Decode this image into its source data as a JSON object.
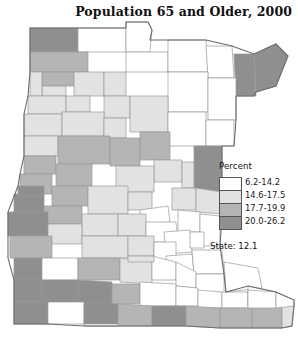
{
  "title": "Population 65 and Older, 2000",
  "legend": {
    "heading": "Percent",
    "classes": [
      {
        "label": "6.2-14.2",
        "color": "#ffffff"
      },
      {
        "label": "14.6-17.5",
        "color": "#e2e2e2"
      },
      {
        "label": "17.7-19.9",
        "color": "#b5b5b5"
      },
      {
        "label": "20.0-26.2",
        "color": "#8f8f8f"
      }
    ],
    "state_label": "State: 12.1"
  },
  "map": {
    "region": "Minnesota",
    "unit": "county",
    "outline_color": "#6b6b6b",
    "border_color": "#9a9a9a",
    "counties": [
      {
        "name": "Kittson",
        "class": 3,
        "d": "M30,28 L78,28 L78,52 L30,52 Z"
      },
      {
        "name": "Roseau",
        "class": 0,
        "d": "M78,28 L126,28 L126,52 L78,52 Z"
      },
      {
        "name": "Lake of the Woods",
        "class": 0,
        "d": "M126,22 L148,22 L152,30 L150,52 L126,52 Z"
      },
      {
        "name": "Marshall",
        "class": 2,
        "d": "M30,52 L88,52 L88,72 L30,72 Z"
      },
      {
        "name": "Beltrami-N",
        "class": 0,
        "d": "M126,52 L168,52 L168,72 L126,72 Z"
      },
      {
        "name": "Koochiching",
        "class": 0,
        "d": "M168,40 L206,40 L208,72 L168,72 Z"
      },
      {
        "name": "St. Louis-N",
        "class": 0,
        "d": "M206,46 L232,46 L234,78 L208,78 Z"
      },
      {
        "name": "Lake",
        "class": 3,
        "d": "M234,54 L254,54 L256,96 L236,96 Z"
      },
      {
        "name": "Cook",
        "class": 3,
        "d": "M254,54 L276,44 L288,56 L276,86 L256,92 Z"
      },
      {
        "name": "Pennington",
        "class": 2,
        "d": "M42,72 L74,72 L74,86 L42,86 Z"
      },
      {
        "name": "Red Lake",
        "class": 1,
        "d": "M42,86 L66,86 L66,96 L42,96 Z"
      },
      {
        "name": "Polk",
        "class": 1,
        "d": "M30,72 L42,72 L42,96 L30,96 Z"
      },
      {
        "name": "Clearwater",
        "class": 1,
        "d": "M74,72 L104,72 L104,96 L74,96 Z"
      },
      {
        "name": "Beltrami-S",
        "class": 1,
        "d": "M104,72 L126,72 L126,96 L104,96 Z"
      },
      {
        "name": "Itasca",
        "class": 0,
        "d": "M168,72 L208,72 L208,112 L168,112 Z"
      },
      {
        "name": "St. Louis-C",
        "class": 0,
        "d": "M208,78 L236,78 L236,120 L208,120 Z"
      },
      {
        "name": "Norman",
        "class": 1,
        "d": "M28,96 L66,96 L66,114 L28,114 Z"
      },
      {
        "name": "Mahnomen",
        "class": 1,
        "d": "M66,96 L90,96 L90,112 L66,112 Z"
      },
      {
        "name": "Hubbard",
        "class": 1,
        "d": "M104,96 L130,96 L130,118 L104,118 Z"
      },
      {
        "name": "Cass",
        "class": 1,
        "d": "M130,96 L168,96 L168,132 L130,132 Z"
      },
      {
        "name": "Clay",
        "class": 1,
        "d": "M24,114 L62,114 L62,136 L24,136 Z"
      },
      {
        "name": "Becker",
        "class": 1,
        "d": "M62,112 L104,112 L104,136 L62,136 Z"
      },
      {
        "name": "Wadena",
        "class": 1,
        "d": "M104,118 L126,118 L126,138 L104,138 Z"
      },
      {
        "name": "Aitkin",
        "class": 0,
        "d": "M168,112 L206,112 L206,146 L168,146 Z"
      },
      {
        "name": "Carlton",
        "class": 0,
        "d": "M206,120 L234,120 L234,146 L206,146 Z"
      },
      {
        "name": "Wilkin",
        "class": 1,
        "d": "M24,136 L58,136 L58,156 L24,156 Z"
      },
      {
        "name": "Otter Tail",
        "class": 2,
        "d": "M58,136 L110,136 L110,164 L58,164 Z"
      },
      {
        "name": "Todd",
        "class": 2,
        "d": "M110,138 L140,138 L140,166 L110,166 Z"
      },
      {
        "name": "Crow Wing",
        "class": 2,
        "d": "M140,132 L170,132 L170,160 L140,160 Z"
      },
      {
        "name": "Mille Lacs",
        "class": 1,
        "d": "M154,160 L182,160 L182,182 L154,182 Z"
      },
      {
        "name": "Pine",
        "class": 3,
        "d": "M194,146 L222,146 L222,192 L194,192 Z"
      },
      {
        "name": "Kanabec",
        "class": 1,
        "d": "M182,162 L194,162 L194,188 L182,188 Z"
      },
      {
        "name": "Grant",
        "class": 2,
        "d": "M24,156 L56,156 L56,174 L24,174 Z"
      },
      {
        "name": "Douglas",
        "class": 2,
        "d": "M56,164 L92,164 L92,186 L56,186 Z"
      },
      {
        "name": "Morrison",
        "class": 1,
        "d": "M116,166 L154,166 L154,192 L116,192 Z"
      },
      {
        "name": "Stevens",
        "class": 2,
        "d": "M20,174 L52,174 L52,194 L20,194 Z"
      },
      {
        "name": "Pope",
        "class": 2,
        "d": "M52,186 L88,186 L88,206 L52,206 Z"
      },
      {
        "name": "Stearns",
        "class": 1,
        "d": "M88,186 L128,186 L128,214 L88,214 Z"
      },
      {
        "name": "Benton",
        "class": 1,
        "d": "M128,192 L152,192 L152,210 L128,210 Z"
      },
      {
        "name": "Sherburne",
        "class": 0,
        "d": "M140,210 L168,206 L170,222 L140,226 Z"
      },
      {
        "name": "Isanti",
        "class": 1,
        "d": "M172,188 L196,188 L196,210 L172,210 Z"
      },
      {
        "name": "Chisago",
        "class": 1,
        "d": "M196,188 L222,192 L222,214 L196,212 Z"
      },
      {
        "name": "Big Stone",
        "class": 3,
        "d": "M14,194 L44,194 L44,212 L14,212 Z"
      },
      {
        "name": "Swift",
        "class": 2,
        "d": "M44,206 L82,206 L82,224 L44,224 Z"
      },
      {
        "name": "Traverse",
        "class": 3,
        "d": "M18,186 L44,186 L44,196 L18,196 Z"
      },
      {
        "name": "Kandiyohi",
        "class": 1,
        "d": "M82,214 L118,214 L118,236 L82,236 Z"
      },
      {
        "name": "Meeker",
        "class": 1,
        "d": "M118,214 L146,214 L146,236 L118,236 Z"
      },
      {
        "name": "Wright",
        "class": 0,
        "d": "M146,222 L176,222 L178,242 L146,242 Z"
      },
      {
        "name": "Anoka",
        "class": 0,
        "d": "M178,210 L200,212 L200,232 L178,232 Z"
      },
      {
        "name": "Washington",
        "class": 0,
        "d": "M200,214 L220,216 L220,246 L200,246 Z"
      },
      {
        "name": "Hennepin",
        "class": 0,
        "d": "M164,232 L190,230 L192,252 L166,254 Z"
      },
      {
        "name": "Ramsey",
        "class": 0,
        "d": "M190,232 L204,232 L204,248 L190,248 Z"
      },
      {
        "name": "Lac qui Parle",
        "class": 3,
        "d": "M8,212 L48,212 L48,236 L8,236 Z"
      },
      {
        "name": "Chippewa",
        "class": 1,
        "d": "M48,224 L82,224 L82,244 L48,244 Z"
      },
      {
        "name": "Renville",
        "class": 1,
        "d": "M82,236 L128,236 L128,258 L82,258 Z"
      },
      {
        "name": "McLeod",
        "class": 1,
        "d": "M128,236 L154,236 L154,256 L128,256 Z"
      },
      {
        "name": "Carver",
        "class": 0,
        "d": "M154,242 L176,242 L176,260 L154,260 Z"
      },
      {
        "name": "Scott",
        "class": 0,
        "d": "M166,256 L192,254 L194,272 L166,272 Z"
      },
      {
        "name": "Dakota",
        "class": 0,
        "d": "M192,250 L222,250 L224,274 L194,274 Z"
      },
      {
        "name": "Yellow Medicine",
        "class": 2,
        "d": "M10,236 L52,236 L52,258 L10,258 Z"
      },
      {
        "name": "Lincoln",
        "class": 3,
        "d": "M14,258 L42,258 L42,280 L14,280 Z"
      },
      {
        "name": "Lyon",
        "class": 0,
        "d": "M42,258 L78,258 L78,280 L42,280 Z"
      },
      {
        "name": "Redwood",
        "class": 2,
        "d": "M78,258 L120,258 L120,280 L78,280 Z"
      },
      {
        "name": "Brown",
        "class": 1,
        "d": "M120,258 L152,262 L152,284 L120,282 Z"
      },
      {
        "name": "Nicollet",
        "class": 0,
        "d": "M152,256 L176,262 L176,280 L152,280 Z"
      },
      {
        "name": "Le Sueur",
        "class": 0,
        "d": "M176,262 L196,272 L196,288 L176,286 Z"
      },
      {
        "name": "Rice",
        "class": 0,
        "d": "M196,274 L224,274 L224,294 L196,292 Z"
      },
      {
        "name": "Goodhue",
        "class": 0,
        "d": "M224,262 L258,268 L262,288 L226,292 Z"
      },
      {
        "name": "Pipestone",
        "class": 3,
        "d": "M14,280 L42,280 L42,302 L14,302 Z"
      },
      {
        "name": "Murray",
        "class": 3,
        "d": "M42,280 L78,280 L78,302 L42,302 Z"
      },
      {
        "name": "Cottonwood",
        "class": 3,
        "d": "M78,280 L112,282 L112,304 L78,304 Z"
      },
      {
        "name": "Watonwan",
        "class": 2,
        "d": "M112,284 L140,284 L140,304 L112,304 Z"
      },
      {
        "name": "Blue Earth",
        "class": 0,
        "d": "M140,282 L176,284 L176,306 L140,306 Z"
      },
      {
        "name": "Waseca",
        "class": 0,
        "d": "M176,286 L198,288 L198,306 L176,306 Z"
      },
      {
        "name": "Steele",
        "class": 0,
        "d": "M198,290 L222,292 L222,308 L198,308 Z"
      },
      {
        "name": "Dodge",
        "class": 0,
        "d": "M222,292 L248,292 L248,308 L222,308 Z"
      },
      {
        "name": "Wabasha",
        "class": 0,
        "d": "M248,286 L276,292 L278,306 L248,306 Z"
      },
      {
        "name": "Rock",
        "class": 3,
        "d": "M14,302 L48,302 L48,324 L14,324 Z"
      },
      {
        "name": "Nobles",
        "class": 0,
        "d": "M48,302 L84,302 L84,324 L48,324 Z"
      },
      {
        "name": "Jackson",
        "class": 3,
        "d": "M84,304 L118,304 L118,326 L84,326 Z"
      },
      {
        "name": "Martin",
        "class": 2,
        "d": "M118,304 L152,306 L152,326 L118,326 Z"
      },
      {
        "name": "Faribault",
        "class": 3,
        "d": "M152,306 L186,306 L186,326 L152,326 Z"
      },
      {
        "name": "Freeborn",
        "class": 2,
        "d": "M186,306 L220,308 L220,328 L186,326 Z"
      },
      {
        "name": "Mower",
        "class": 2,
        "d": "M220,308 L252,308 L252,328 L220,328 Z"
      },
      {
        "name": "Fillmore",
        "class": 2,
        "d": "M252,306 L282,306 L282,328 L252,328 Z"
      },
      {
        "name": "Houston",
        "class": 1,
        "d": "M282,300 L294,304 L292,326 L282,328 Z"
      },
      {
        "name": "Olmsted",
        "class": 0,
        "d": "M248,290 L276,292 L276,308 L248,308 Z"
      },
      {
        "name": "Winona",
        "class": 0,
        "d": "M276,292 L294,300 L294,306 L276,308 Z"
      },
      {
        "name": "Sibley",
        "class": 1,
        "d": "M128,256 L154,256 L154,262 L128,262 Z"
      },
      {
        "name": "Nobles-edge",
        "class": 0,
        "d": "M84,324 L118,324 L118,326 L84,326 Z"
      }
    ],
    "outline": "M30,28 L126,28 L126,22 L148,22 L152,30 L150,40 L168,40 L206,40 L232,46 L254,54 L276,44 L288,56 L276,86 L256,92 L254,96 L236,96 L236,120 L234,146 L222,146 L222,192 L222,216 L220,246 L224,274 L226,292 L248,286 L276,292 L294,300 L294,306 L292,326 L282,328 L252,328 L220,328 L186,326 L152,326 L118,326 L84,326 L48,324 L14,324 L14,302 L14,280 L8,258 L8,236 L8,212 L18,186 L20,174 L24,156 L24,136 L24,114 L28,96 L30,72 Z"
  }
}
